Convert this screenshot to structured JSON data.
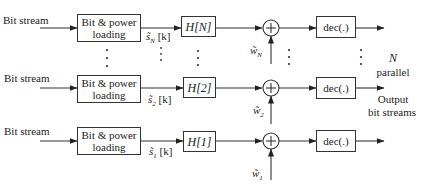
{
  "diagram": {
    "type": "block-diagram",
    "title": "",
    "rows": [
      {
        "id": "N",
        "input_label": "Bit stream",
        "loading_block": "Bit & power loading",
        "loading_line1": "Bit & power",
        "loading_line2": "loading",
        "signal_label": "s̃_N [k]",
        "signal_main": "s̃",
        "signal_sub": "N",
        "signal_arg": "[k]",
        "channel_block": "H[N]",
        "noise_label": "w̃_N",
        "noise_main": "w̃",
        "noise_sub": "N",
        "adder": "+",
        "decoder_block": "dec(.)"
      },
      {
        "id": "2",
        "input_label": "Bit stream",
        "loading_block": "Bit & power loading",
        "loading_line1": "Bit & power",
        "loading_line2": "loading",
        "signal_label": "s̃_2 [k]",
        "signal_main": "s̃",
        "signal_sub": "2",
        "signal_arg": "[k]",
        "channel_block": "H[2]",
        "noise_label": "w̃_2",
        "noise_main": "w̃",
        "noise_sub": "2",
        "adder": "+",
        "decoder_block": "dec(.)"
      },
      {
        "id": "1",
        "input_label": "Bit stream",
        "loading_block": "Bit & power loading",
        "loading_line1": "Bit & power",
        "loading_line2": "loading",
        "signal_label": "s̃_1 [k]",
        "signal_main": "s̃",
        "signal_sub": "1",
        "signal_arg": "[k]",
        "channel_block": "H[1]",
        "noise_label": "w̃_1",
        "noise_main": "w̃",
        "noise_sub": "1",
        "adder": "+",
        "decoder_block": "dec(.)"
      }
    ],
    "output_annotation": {
      "line1": "N",
      "line2": "parallel",
      "line3": "Output",
      "line4": "bit streams"
    },
    "ellipsis": "⋮"
  }
}
